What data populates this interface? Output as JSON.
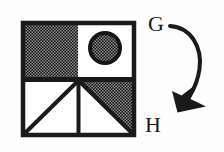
{
  "figure": {
    "background_color": "#fdfdfd",
    "ink_color": "#1a1a1a",
    "shade_color": "#2b2b2b",
    "square": {
      "name": "subdivided-square",
      "x": 21,
      "y": 21,
      "width": 115,
      "height": 116,
      "border_width": 4,
      "center_x": 78.5,
      "center_y": 79
    },
    "quadrants": [
      {
        "name": "top-left-quadrant",
        "position": "top-left",
        "fill": "shaded",
        "description": "fully shaded with halftone dot pattern"
      },
      {
        "name": "top-right-quadrant",
        "position": "top-right",
        "fill": "white",
        "description": "white with shaded circle"
      },
      {
        "name": "bottom-left-quadrant",
        "position": "bottom-left",
        "fill": "white",
        "description": "white with diagonal line from bottom-left to top-right"
      },
      {
        "name": "bottom-right-quadrant",
        "position": "bottom-right",
        "fill": "half-shaded",
        "description": "upper-right triangle shaded, lower-left triangle white"
      }
    ],
    "circle": {
      "name": "shaded-circle",
      "cx": 105,
      "cy": 48,
      "r": 16,
      "ring_width": 4,
      "fill": "shaded"
    },
    "diagonal_line": {
      "name": "bottom-left-diagonal",
      "x1": 23,
      "y1": 135,
      "x2": 77,
      "y2": 81,
      "stroke_width": 4
    },
    "arrow": {
      "name": "transformation-arrow",
      "from_label": "G",
      "to_label": "H",
      "stroke_width": 4,
      "path": "M 170 26 C 191 27 203 46 199 70 C 197 82 192 91 187 98",
      "head_tip_x": 178,
      "head_tip_y": 112
    },
    "labels": [
      {
        "name": "label-g",
        "text": "G",
        "x": 148,
        "y": 31,
        "font_size": 24
      },
      {
        "name": "label-h",
        "text": "H",
        "x": 145,
        "y": 132,
        "font_size": 24
      }
    ]
  }
}
